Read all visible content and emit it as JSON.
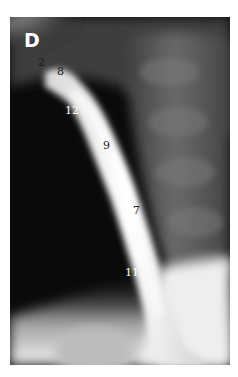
{
  "figure": {
    "panel_letter": "D",
    "labels": [
      {
        "text": "2",
        "x": 38,
        "y": 57,
        "color": "#1a1a1a"
      },
      {
        "text": "8",
        "x": 57,
        "y": 66,
        "color": "#1a1a1a"
      },
      {
        "text": "12",
        "x": 65,
        "y": 105,
        "color": "#ffffff"
      },
      {
        "text": "9",
        "x": 103,
        "y": 140,
        "color": "#222222"
      },
      {
        "text": "7",
        "x": 133,
        "y": 205,
        "color": "#222222"
      },
      {
        "text": "11",
        "x": 125,
        "y": 267,
        "color": "#ffffff"
      }
    ]
  }
}
